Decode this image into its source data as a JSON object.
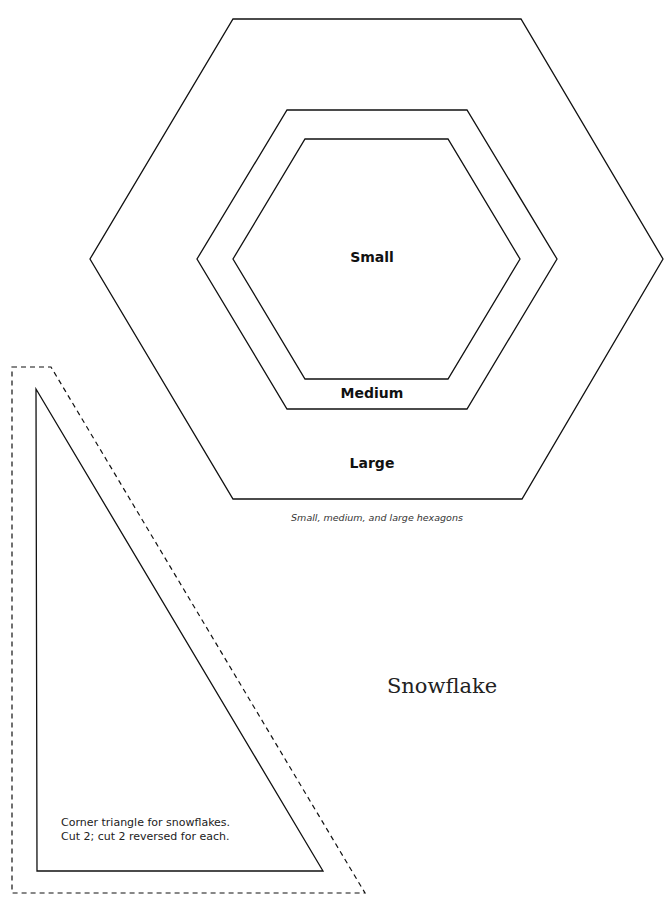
{
  "hexagons": {
    "large": {
      "label": "Large",
      "points": "233,19 521,19 663,259 522,499 233,499 90,259"
    },
    "medium": {
      "label": "Medium",
      "points": "287,110 467,110 557,259 467,409 287,409 197,259"
    },
    "small": {
      "label": "Small",
      "points": "305,139 448,139 520,259 448,379 305,379 233,259"
    },
    "caption": "Small, medium, and large hexagons"
  },
  "block_title": "Snowflake",
  "triangle": {
    "cut_line_points": "12,367 51,367 365,893 12,893",
    "sew_line_points": "36,389 323,871 37,871",
    "note_lines": [
      "Corner triangle for snowflakes.",
      "Cut 2; cut 2 reversed for each."
    ]
  },
  "colors": {
    "line": "#111111",
    "background": "#ffffff"
  }
}
